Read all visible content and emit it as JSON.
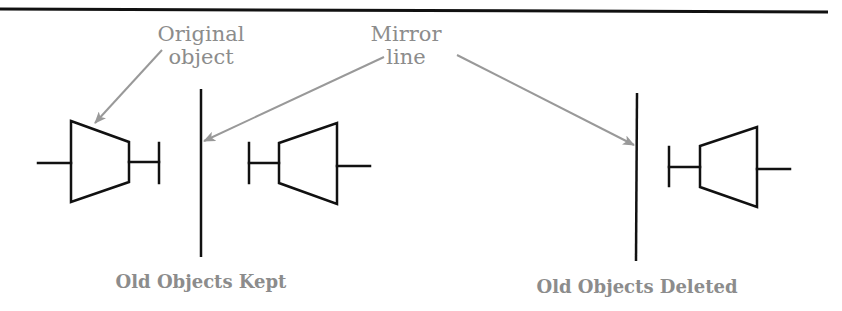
{
  "diagram": {
    "colors": {
      "line": "#111111",
      "callout": "#999999",
      "text": "#8c8c8c",
      "background": "#ffffff"
    },
    "callouts": {
      "original_object": {
        "line1": "Original",
        "line2": "object"
      },
      "mirror_line": {
        "line1": "Mirror",
        "line2": "line"
      }
    },
    "panels": [
      {
        "id": "kept",
        "caption": "Old Objects Kept",
        "objects_shown": [
          "original",
          "mirrored"
        ]
      },
      {
        "id": "deleted",
        "caption": "Old Objects Deleted",
        "objects_shown": [
          "mirrored"
        ]
      }
    ],
    "icons": {
      "object_symbol": "trapezoid-with-stem-and-t-bar",
      "mirror_line": "vertical-line",
      "arrow": "gray-callout-arrow"
    }
  }
}
